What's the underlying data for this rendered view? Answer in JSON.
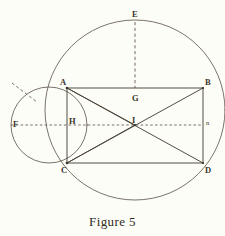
{
  "figure": {
    "caption": "Figure 5",
    "caption_x": 112,
    "caption_y": 214,
    "background_color": "#fdfdf7",
    "ink_color": "#4a4338",
    "ink_color_light": "#6b6254"
  },
  "points": [
    {
      "id": "E",
      "label": "E",
      "x": 135,
      "y": 20,
      "label_x": 132,
      "label_y": 10,
      "size": "normal"
    },
    {
      "id": "A",
      "label": "A",
      "x": 67,
      "y": 88,
      "label_x": 60,
      "label_y": 78,
      "size": "normal"
    },
    {
      "id": "B",
      "label": "B",
      "x": 203,
      "y": 88,
      "label_x": 205,
      "label_y": 78,
      "size": "normal"
    },
    {
      "id": "G",
      "label": "G",
      "x": 135,
      "y": 88,
      "label_x": 132,
      "label_y": 94,
      "size": "normal"
    },
    {
      "id": "F",
      "label": "F",
      "x": 31,
      "y": 125,
      "label_x": 13,
      "label_y": 120,
      "size": "normal"
    },
    {
      "id": "H",
      "label": "H",
      "x": 67,
      "y": 125,
      "label_x": 69,
      "label_y": 117,
      "size": "normal"
    },
    {
      "id": "I",
      "label": "I",
      "x": 135,
      "y": 125,
      "label_x": 132,
      "label_y": 116,
      "size": "normal"
    },
    {
      "id": "n",
      "label": "n",
      "x": 203,
      "y": 125,
      "label_x": 206,
      "label_y": 120,
      "size": "small"
    },
    {
      "id": "C",
      "label": "C",
      "x": 67,
      "y": 163,
      "label_x": 61,
      "label_y": 166,
      "size": "normal"
    },
    {
      "id": "D",
      "label": "D",
      "x": 203,
      "y": 163,
      "label_x": 205,
      "label_y": 166,
      "size": "normal"
    }
  ],
  "geometry": {
    "big_circle": {
      "cx": 135,
      "cy": 110,
      "r": 90
    },
    "small_circle": {
      "cx": 49,
      "cy": 125,
      "r": 38
    },
    "rectangle": {
      "left": 67,
      "right": 203,
      "top": 88,
      "bottom": 163
    },
    "diagonals": [
      {
        "from": "A",
        "to": "D"
      },
      {
        "from": "B",
        "to": "C"
      }
    ],
    "chords": [
      {
        "from": "A",
        "to": "C"
      },
      {
        "from": "C",
        "to": "I"
      },
      {
        "from": "A",
        "to": "I"
      }
    ],
    "dashed_lines": [
      {
        "name": "EG-vertical",
        "x1": 135,
        "y1": 22,
        "x2": 135,
        "y2": 88
      },
      {
        "name": "FIn-horizontal",
        "x1": 31,
        "y1": 125,
        "x2": 203,
        "y2": 125
      },
      {
        "name": "pointer-to-small-circle",
        "x1": 12,
        "y1": 83,
        "x2": 36,
        "y2": 101
      }
    ]
  }
}
